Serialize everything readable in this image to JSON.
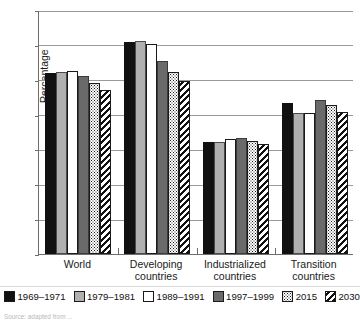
{
  "chart_data": {
    "type": "bar",
    "title": "",
    "xlabel": "",
    "ylabel": "Percentage",
    "ylim": [
      0,
      70
    ],
    "yticks": [
      0,
      10,
      20,
      30,
      40,
      50,
      60,
      70
    ],
    "grid": true,
    "legend_position": "bottom",
    "categories": [
      "World",
      "Developing countries",
      "Industrialized countries",
      "Transition countries"
    ],
    "category_lines": [
      [
        "World"
      ],
      [
        "Developing",
        "countries"
      ],
      [
        "Industrialized",
        "countries"
      ],
      [
        "Transition",
        "countries"
      ]
    ],
    "series": [
      {
        "name": "1969–1971",
        "pattern": "solid-black",
        "color": "#111111",
        "values": [
          51.8,
          60.8,
          32.0,
          43.2
        ]
      },
      {
        "name": "1979–1981",
        "pattern": "solid-gray",
        "color": "#b0b0b0",
        "values": [
          52.2,
          61.2,
          32.0,
          40.4
        ]
      },
      {
        "name": "1989–1991",
        "pattern": "solid-white",
        "color": "#ffffff",
        "values": [
          52.6,
          60.2,
          32.9,
          40.4
        ]
      },
      {
        "name": "1997–1999",
        "pattern": "solid-dkgray",
        "color": "#6a6a6a",
        "values": [
          51.1,
          55.5,
          33.4,
          44.3
        ]
      },
      {
        "name": "2015",
        "pattern": "dotted",
        "color": "#ffffff",
        "values": [
          49.1,
          52.2,
          32.3,
          42.8
        ]
      },
      {
        "name": "2030",
        "pattern": "diagonal-hatch",
        "color": "#ffffff",
        "values": [
          47.0,
          49.7,
          31.6,
          40.7
        ]
      }
    ]
  },
  "legend": {
    "items": [
      {
        "label": "1969–1971",
        "swatch": "legend-swatch-black"
      },
      {
        "label": "1979–1981",
        "swatch": "legend-swatch-gray"
      },
      {
        "label": "1989–1991",
        "swatch": "legend-swatch-white"
      },
      {
        "label": "1997–1999",
        "swatch": "legend-swatch-darkgray"
      },
      {
        "label": "2015",
        "swatch": "legend-swatch-dotted"
      },
      {
        "label": "2030",
        "swatch": "legend-swatch-hatched"
      }
    ]
  },
  "source_note": "Source: adapted from ... "
}
